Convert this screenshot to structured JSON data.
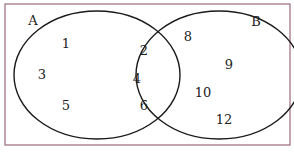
{
  "diagram": {
    "type": "venn",
    "frame": {
      "x": 5,
      "y": 4,
      "width": 285,
      "height": 141,
      "color": "#9a6a78"
    },
    "sets": [
      {
        "label": "A",
        "cx": 97,
        "cy": 75,
        "rx": 83,
        "ry": 64,
        "label_x": 33,
        "label_y": 25
      },
      {
        "label": "B",
        "cx": 219,
        "cy": 75,
        "rx": 83,
        "ry": 64,
        "label_x": 256,
        "label_y": 26
      }
    ],
    "regions": {
      "only_A": [
        "1",
        "3",
        "5"
      ],
      "A_and_B": [
        "2",
        "4",
        "6"
      ],
      "only_B": [
        "8",
        "9",
        "10",
        "12"
      ]
    },
    "elements": [
      {
        "value": "1",
        "x": 66,
        "y": 44
      },
      {
        "value": "3",
        "x": 42,
        "y": 75
      },
      {
        "value": "5",
        "x": 66,
        "y": 106
      },
      {
        "value": "2",
        "x": 144,
        "y": 51
      },
      {
        "value": "4",
        "x": 137,
        "y": 79
      },
      {
        "value": "6",
        "x": 144,
        "y": 106
      },
      {
        "value": "8",
        "x": 188,
        "y": 37
      },
      {
        "value": "9",
        "x": 229,
        "y": 65
      },
      {
        "value": "10",
        "x": 203,
        "y": 93
      },
      {
        "value": "12",
        "x": 224,
        "y": 120
      }
    ]
  }
}
